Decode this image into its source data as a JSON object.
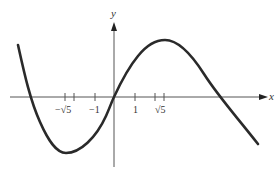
{
  "figure": {
    "axes": {
      "x_label": "x",
      "y_label": "y"
    },
    "ticks": [
      {
        "label": "−√5",
        "value": -2.236
      },
      {
        "label": "",
        "value": -2
      },
      {
        "label": "−1",
        "value": -1
      },
      {
        "label": "1",
        "value": 1
      },
      {
        "label": "",
        "value": 2
      },
      {
        "label": "√5",
        "value": 2.236
      }
    ],
    "tick_labels": {
      "neg_sqrt5": "−√5",
      "neg_one": "−1",
      "one": "1",
      "sqrt5": "√5"
    },
    "curve": {
      "description": "cubic-like curve with local minimum near x = −√5 and local maximum near x = √5, passing through origin",
      "color": "#2a2a2a"
    },
    "colors": {
      "axis": "#555555",
      "curve": "#2a2a2a",
      "background": "#ffffff"
    }
  }
}
